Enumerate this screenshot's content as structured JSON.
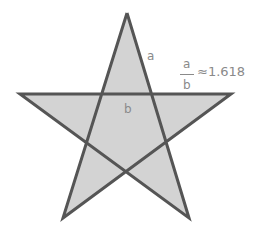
{
  "diagram": {
    "shape": "pentagram",
    "colors": {
      "fill": "#d3d3d3",
      "stroke": "#555555",
      "label": "#8a8a8a",
      "background": "#ffffff"
    },
    "vertices": {
      "top": [
        127,
        13
      ],
      "left": [
        20,
        94
      ],
      "right": [
        231,
        94
      ],
      "bottom_left": [
        63,
        218
      ],
      "bottom_right": [
        189,
        218
      ]
    },
    "labels": {
      "segment_a": "a",
      "segment_b": "b",
      "ratio_numerator": "a",
      "ratio_denominator": "b",
      "ratio_value": "≈1.618"
    }
  }
}
